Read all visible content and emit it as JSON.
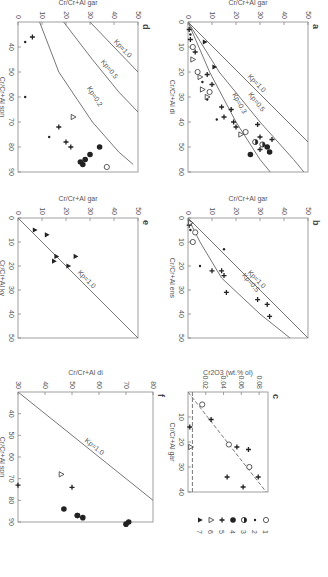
{
  "figure": {
    "legend": {
      "items": [
        {
          "n": "1",
          "symbol": "open-circle"
        },
        {
          "n": "2",
          "symbol": "small-dot"
        },
        {
          "n": "3",
          "symbol": "half-filled-circle"
        },
        {
          "n": "4",
          "symbol": "filled-circle"
        },
        {
          "n": "5",
          "symbol": "plus-star"
        },
        {
          "n": "6",
          "symbol": "open-triangle"
        },
        {
          "n": "7",
          "symbol": "filled-triangle"
        }
      ]
    }
  },
  "chart_data": [
    {
      "id": "a",
      "type": "scatter",
      "panel_label": "a",
      "xlabel": "Cr/Cr+Al di",
      "ylabel": "Cr/Cr+Al gar",
      "xlim": [
        0,
        60
      ],
      "ylim": [
        0,
        50
      ],
      "xticks": [
        0,
        10,
        20,
        30,
        40,
        50,
        60
      ],
      "yticks": [
        0,
        10,
        20,
        30,
        40,
        50
      ],
      "curves": [
        {
          "label": "Kp=1.0",
          "points": [
            [
              0,
              0
            ],
            [
              48,
              50
            ]
          ]
        },
        {
          "label": "Kp=0.5",
          "points": [
            [
              0,
              0
            ],
            [
              20,
              13
            ],
            [
              40,
              30
            ],
            [
              55,
              44
            ],
            [
              62,
              50
            ]
          ]
        },
        {
          "label": "Kp=0.3",
          "points": [
            [
              0,
              0
            ],
            [
              20,
              9
            ],
            [
              40,
              20
            ],
            [
              55,
              30
            ],
            [
              62,
              36
            ]
          ]
        }
      ],
      "points": [
        {
          "x": 52,
          "y": 34,
          "s": "4"
        },
        {
          "x": 50,
          "y": 33,
          "s": "4"
        },
        {
          "x": 53,
          "y": 26,
          "s": "4"
        },
        {
          "x": 49,
          "y": 31,
          "s": "3"
        },
        {
          "x": 48,
          "y": 28,
          "s": "3"
        },
        {
          "x": 51,
          "y": 30,
          "s": "5"
        },
        {
          "x": 47,
          "y": 35,
          "s": "5"
        },
        {
          "x": 46,
          "y": 30,
          "s": "5"
        },
        {
          "x": 45,
          "y": 22,
          "s": "6"
        },
        {
          "x": 44,
          "y": 24,
          "s": "1"
        },
        {
          "x": 42,
          "y": 20,
          "s": "5"
        },
        {
          "x": 41,
          "y": 29,
          "s": "5"
        },
        {
          "x": 40,
          "y": 19,
          "s": "5"
        },
        {
          "x": 39,
          "y": 12,
          "s": "2"
        },
        {
          "x": 38,
          "y": 15,
          "s": "5"
        },
        {
          "x": 35,
          "y": 18,
          "s": "5"
        },
        {
          "x": 34,
          "y": 14,
          "s": "5"
        },
        {
          "x": 31,
          "y": 8,
          "s": "2"
        },
        {
          "x": 30,
          "y": 8,
          "s": "6"
        },
        {
          "x": 28,
          "y": 9,
          "s": "1"
        },
        {
          "x": 27,
          "y": 6,
          "s": "6"
        },
        {
          "x": 25,
          "y": 10,
          "s": "5"
        },
        {
          "x": 24,
          "y": 6,
          "s": "2"
        },
        {
          "x": 22,
          "y": 5,
          "s": "6"
        },
        {
          "x": 21,
          "y": 8,
          "s": "5"
        },
        {
          "x": 20,
          "y": 4,
          "s": "1"
        },
        {
          "x": 18,
          "y": 11,
          "s": "7"
        },
        {
          "x": 15,
          "y": 2,
          "s": "6"
        },
        {
          "x": 12,
          "y": 3,
          "s": "5"
        },
        {
          "x": 10,
          "y": 2,
          "s": "1"
        },
        {
          "x": 8,
          "y": 7,
          "s": "7"
        },
        {
          "x": 7,
          "y": 1,
          "s": "5"
        },
        {
          "x": 5,
          "y": 1,
          "s": "2"
        },
        {
          "x": 3,
          "y": 0.5,
          "s": "5"
        }
      ]
    },
    {
      "id": "b",
      "type": "scatter",
      "panel_label": "b",
      "xlabel": "Cr/Cr+Al ens",
      "ylabel": "Cr/Cr+Al gar",
      "xlim": [
        0,
        50
      ],
      "ylim": [
        0,
        50
      ],
      "xticks": [
        0,
        10,
        20,
        30,
        40,
        50
      ],
      "yticks": [
        0,
        10,
        20,
        30,
        40,
        50
      ],
      "curves": [
        {
          "label": "Kp=1.0",
          "points": [
            [
              0,
              0
            ],
            [
              50,
              50
            ]
          ]
        },
        {
          "label": "Kp=0.5",
          "points": [
            [
              0,
              0
            ],
            [
              10,
              5
            ],
            [
              25,
              14
            ],
            [
              40,
              30
            ],
            [
              52,
              45
            ]
          ]
        }
      ],
      "points": [
        {
          "x": 41,
          "y": 34,
          "s": "5"
        },
        {
          "x": 36,
          "y": 33,
          "s": "5"
        },
        {
          "x": 34,
          "y": 29,
          "s": "5"
        },
        {
          "x": 31,
          "y": 16,
          "s": "5"
        },
        {
          "x": 24,
          "y": 15,
          "s": "5"
        },
        {
          "x": 22,
          "y": 14,
          "s": "5"
        },
        {
          "x": 22,
          "y": 10,
          "s": "5"
        },
        {
          "x": 20,
          "y": 5,
          "s": "2"
        },
        {
          "x": 13,
          "y": 15,
          "s": "2"
        },
        {
          "x": 10,
          "y": 2,
          "s": "1"
        },
        {
          "x": 6,
          "y": 3,
          "s": "1"
        },
        {
          "x": 5,
          "y": 1,
          "s": "2"
        },
        {
          "x": 3,
          "y": 0.5,
          "s": "5"
        },
        {
          "x": 2,
          "y": 1,
          "s": "6"
        }
      ]
    },
    {
      "id": "c",
      "type": "scatter",
      "panel_label": "c",
      "xlabel": "Cr/Cr+Al gar",
      "ylabel": "Cr2O3 (wt.% ol)",
      "xlim": [
        0,
        40
      ],
      "ylim": [
        0,
        0.09
      ],
      "xticks": [
        10,
        20,
        30,
        40
      ],
      "yticks": [
        0.02,
        0.04,
        0.06,
        0.08
      ],
      "curves": [
        {
          "label": "regression",
          "style": "dashed",
          "points": [
            [
              0,
              0
            ],
            [
              40,
              0.088
            ]
          ]
        },
        {
          "label": "horizontal",
          "style": "dashed",
          "points": [
            [
              0,
              0.005
            ],
            [
              40,
              0.005
            ]
          ]
        }
      ],
      "points": [
        {
          "x": 34,
          "y": 0.079,
          "s": "5"
        },
        {
          "x": 38,
          "y": 0.062,
          "s": "5"
        },
        {
          "x": 34,
          "y": 0.044,
          "s": "5"
        },
        {
          "x": 30,
          "y": 0.069,
          "s": "1"
        },
        {
          "x": 23,
          "y": 0.068,
          "s": "5"
        },
        {
          "x": 22,
          "y": 0.055,
          "s": "5"
        },
        {
          "x": 21,
          "y": 0.046,
          "s": "1"
        },
        {
          "x": 11,
          "y": 0.026,
          "s": "5"
        },
        {
          "x": 5,
          "y": 0.016,
          "s": "1"
        },
        {
          "x": 22,
          "y": 0.003,
          "s": "6"
        },
        {
          "x": 14,
          "y": 0.002,
          "s": "5"
        }
      ]
    },
    {
      "id": "d",
      "type": "scatter",
      "panel_label": "d",
      "xlabel": "Cr/Cr+Al spn",
      "ylabel": "Cr/Cr+Al gar",
      "xlim": [
        30,
        90
      ],
      "ylim": [
        0,
        50
      ],
      "xticks": [
        40,
        50,
        60,
        70,
        80,
        90
      ],
      "yticks": [
        0,
        10,
        20,
        30,
        40,
        50
      ],
      "curves": [
        {
          "label": "Kp=1.0",
          "points": [
            [
              30,
              30
            ],
            [
              50,
              50
            ]
          ]
        },
        {
          "label": "Kp=0.5",
          "points": [
            [
              30,
              19
            ],
            [
              45,
              31
            ],
            [
              58,
              42
            ],
            [
              66,
              50
            ]
          ]
        },
        {
          "label": "Kp=0.2",
          "points": [
            [
              30,
              9
            ],
            [
              50,
              17
            ],
            [
              70,
              31
            ],
            [
              82,
              42
            ],
            [
              87,
              48
            ]
          ]
        }
      ],
      "points": [
        {
          "x": 88,
          "y": 37,
          "s": "1"
        },
        {
          "x": 87,
          "y": 27,
          "s": "4"
        },
        {
          "x": 86,
          "y": 26,
          "s": "4"
        },
        {
          "x": 85,
          "y": 28,
          "s": "4"
        },
        {
          "x": 83,
          "y": 30,
          "s": "4"
        },
        {
          "x": 80,
          "y": 34,
          "s": "4"
        },
        {
          "x": 80,
          "y": 22,
          "s": "5"
        },
        {
          "x": 78,
          "y": 20,
          "s": "5"
        },
        {
          "x": 76,
          "y": 13,
          "s": "2"
        },
        {
          "x": 72,
          "y": 17,
          "s": "5"
        },
        {
          "x": 68,
          "y": 23,
          "s": "6"
        },
        {
          "x": 60,
          "y": 3,
          "s": "2"
        },
        {
          "x": 38,
          "y": 3,
          "s": "2"
        },
        {
          "x": 36,
          "y": 6,
          "s": "5"
        }
      ]
    },
    {
      "id": "e",
      "type": "scatter",
      "panel_label": "e",
      "xlabel": "Cr/Cr+Al ky",
      "ylabel": "Cr/Cr+Al gar",
      "xlim": [
        0,
        50
      ],
      "ylim": [
        0,
        50
      ],
      "xticks": [
        0,
        10,
        20,
        30,
        40,
        50
      ],
      "yticks": [
        0,
        10,
        20,
        30,
        40,
        50
      ],
      "curves": [
        {
          "label": "Kp=1.0",
          "points": [
            [
              0,
              0
            ],
            [
              50,
              50
            ]
          ]
        }
      ],
      "points": [
        {
          "x": 20,
          "y": 21,
          "s": "7"
        },
        {
          "x": 18,
          "y": 15,
          "s": "7"
        },
        {
          "x": 16,
          "y": 24,
          "s": "7"
        },
        {
          "x": 16,
          "y": 16,
          "s": "7"
        },
        {
          "x": 7,
          "y": 12,
          "s": "7"
        },
        {
          "x": 5,
          "y": 7,
          "s": "7"
        }
      ]
    },
    {
      "id": "f",
      "type": "scatter",
      "panel_label": "f",
      "xlabel": "Cr/Cr+Al spn",
      "ylabel": "Cr/Cr+Al di",
      "xlim": [
        30,
        90
      ],
      "ylim": [
        30,
        80
      ],
      "xticks": [
        40,
        50,
        60,
        70,
        80,
        90
      ],
      "yticks": [
        30,
        40,
        50,
        60,
        70,
        80
      ],
      "curves": [
        {
          "label": "Kp=1.0",
          "points": [
            [
              30,
              30
            ],
            [
              80,
              80
            ]
          ]
        }
      ],
      "points": [
        {
          "x": 91,
          "y": 70,
          "s": "4"
        },
        {
          "x": 90,
          "y": 71,
          "s": "4"
        },
        {
          "x": 88,
          "y": 54,
          "s": "4"
        },
        {
          "x": 87,
          "y": 52,
          "s": "4"
        },
        {
          "x": 87,
          "y": 52,
          "s": "4"
        },
        {
          "x": 84,
          "y": 47,
          "s": "4"
        },
        {
          "x": 74,
          "y": 50,
          "s": "5"
        },
        {
          "x": 73,
          "y": 30,
          "s": "5"
        },
        {
          "x": 68,
          "y": 46,
          "s": "6"
        }
      ]
    }
  ]
}
